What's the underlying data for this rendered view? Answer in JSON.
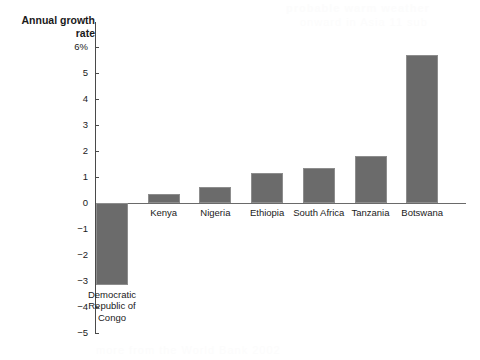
{
  "chart_data": {
    "type": "bar",
    "title": "Annual growth rate",
    "xlabel": "",
    "ylabel": "Annual growth rate",
    "categories": [
      "Democratic\nRepublic of\nCongo",
      "Kenya",
      "Nigeria",
      "Ethiopia",
      "South Africa",
      "Tanzania",
      "Botswana"
    ],
    "values": [
      -3.15,
      0.35,
      0.6,
      1.15,
      1.35,
      1.8,
      5.7
    ],
    "ylim": [
      -5,
      6
    ],
    "ytick_labels": [
      "6%",
      "5",
      "4",
      "3",
      "2",
      "1",
      "0",
      "−1",
      "−2",
      "−3",
      "−4",
      "−5"
    ],
    "ytick_values": [
      6,
      5,
      4,
      3,
      2,
      1,
      0,
      -1,
      -2,
      -3,
      -4,
      -5
    ],
    "grid": false,
    "legend": "none",
    "bar_color": "#6b6b6b",
    "axis_color": "#4a4a4a",
    "background": "#ffffff"
  },
  "ghost": {
    "top": "probable warm weather",
    "second": "onward in Asia  11 sub",
    "bottom": "more  from  the  World  Bank  2002"
  }
}
